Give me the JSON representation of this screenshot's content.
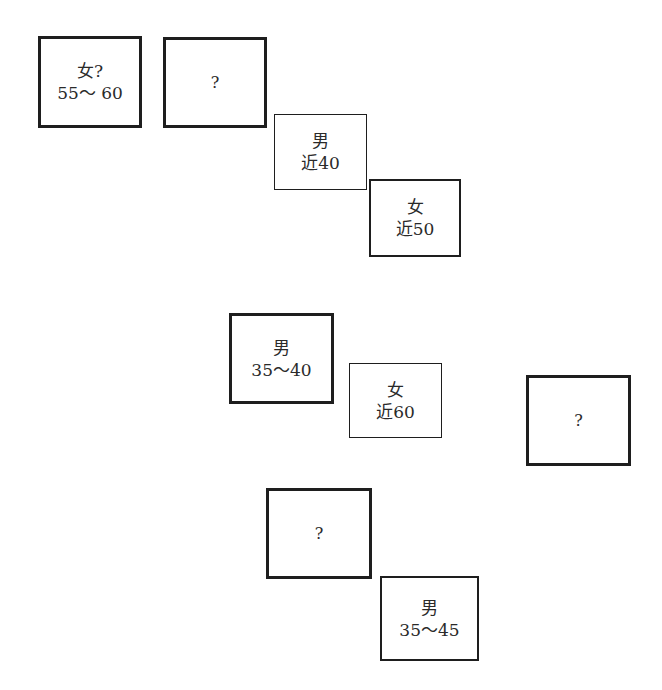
{
  "boxes": [
    {
      "id": "b1",
      "gender": "女?",
      "age": "55～ 60",
      "border": "thick",
      "x": 38,
      "y": 36,
      "w": 104,
      "h": 92
    },
    {
      "id": "b2",
      "gender": "",
      "age": "?",
      "border": "thick",
      "x": 163,
      "y": 37,
      "w": 104,
      "h": 91
    },
    {
      "id": "b3",
      "gender": "男",
      "age": "近40",
      "border": "thin",
      "x": 274,
      "y": 114,
      "w": 93,
      "h": 76
    },
    {
      "id": "b4",
      "gender": "女",
      "age": "近50",
      "border": "medium",
      "x": 369,
      "y": 179,
      "w": 92,
      "h": 78
    },
    {
      "id": "b5",
      "gender": "男",
      "age": "35～40",
      "border": "thick",
      "x": 229,
      "y": 313,
      "w": 105,
      "h": 91
    },
    {
      "id": "b6",
      "gender": "女",
      "age": "近60",
      "border": "thin",
      "x": 349,
      "y": 363,
      "w": 93,
      "h": 75
    },
    {
      "id": "b7",
      "gender": "",
      "age": "?",
      "border": "thick",
      "x": 526,
      "y": 375,
      "w": 105,
      "h": 91
    },
    {
      "id": "b8",
      "gender": "",
      "age": "?",
      "border": "thick",
      "x": 266,
      "y": 488,
      "w": 106,
      "h": 91
    },
    {
      "id": "b9",
      "gender": "男",
      "age": "35～45",
      "border": "medium",
      "x": 380,
      "y": 576,
      "w": 99,
      "h": 85
    }
  ]
}
